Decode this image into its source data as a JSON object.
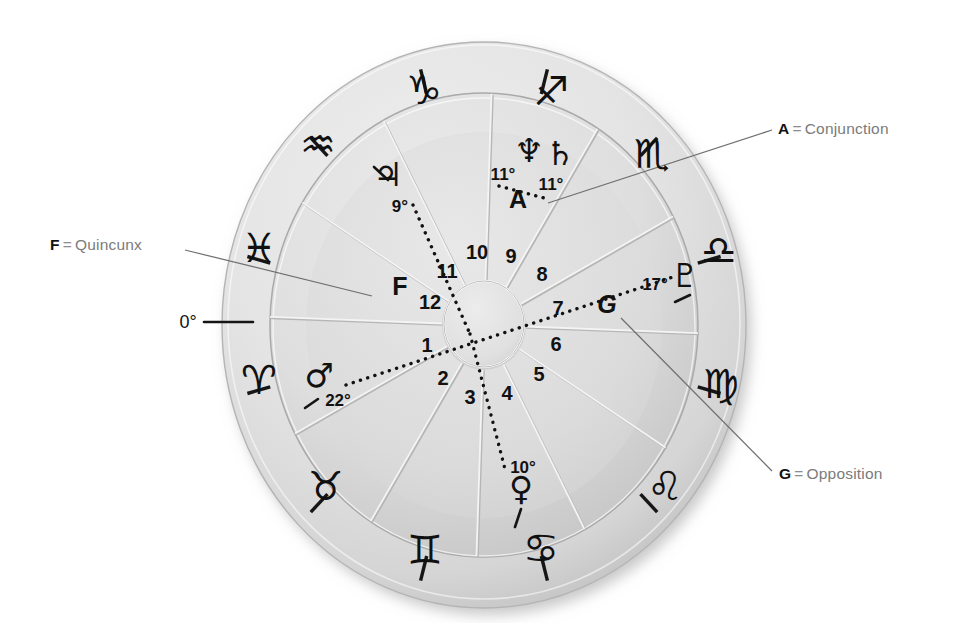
{
  "figure": {
    "type": "astrological-natal-chart-wheel"
  },
  "colors": {
    "background": "#ffffff",
    "disc_light": "#e9e9e9",
    "disc_mid": "#dcdcdc",
    "disc_dark": "#c9c9c9",
    "ink": "#121212",
    "callout_text": "#7b7b7b",
    "leader_line": "#6f6f6f",
    "groove": "#ffffff",
    "groove_shadow": "#b9b9b9"
  },
  "zodiac": {
    "ring_label": "zodiac-outer-ring",
    "signs": [
      {
        "name": "Capricorn",
        "glyph": "♑",
        "slot": 0
      },
      {
        "name": "Sagittarius",
        "glyph": "♐",
        "slot": 1
      },
      {
        "name": "Scorpio",
        "glyph": "♏",
        "slot": 2
      },
      {
        "name": "Libra",
        "glyph": "♎",
        "slot": 3
      },
      {
        "name": "Virgo",
        "glyph": "♍",
        "slot": 4
      },
      {
        "name": "Leo",
        "glyph": "♌",
        "slot": 5
      },
      {
        "name": "Cancer",
        "glyph": "♋",
        "slot": 6
      },
      {
        "name": "Gemini",
        "glyph": "♊",
        "slot": 7
      },
      {
        "name": "Taurus",
        "glyph": "♉",
        "slot": 8
      },
      {
        "name": "Aries",
        "glyph": "♈",
        "slot": 9
      },
      {
        "name": "Pisces",
        "glyph": "♓",
        "slot": 10
      },
      {
        "name": "Aquarius",
        "glyph": "♒",
        "slot": 11
      }
    ]
  },
  "houses": {
    "ring_label": "house-number-ring",
    "numbers": [
      "1",
      "2",
      "3",
      "4",
      "5",
      "6",
      "7",
      "8",
      "9",
      "10",
      "11",
      "12"
    ]
  },
  "planets": [
    {
      "name": "Neptune",
      "glyph": "♆",
      "degree": "11°",
      "label": "Neptune 11 degrees"
    },
    {
      "name": "Saturn",
      "glyph": "♄",
      "degree": "11°",
      "label": "Saturn 11 degrees"
    },
    {
      "name": "Jupiter",
      "glyph": "♃",
      "degree": "9°",
      "label": "Jupiter 9 degrees"
    },
    {
      "name": "Mars",
      "glyph": "♂",
      "degree": "22°",
      "label": "Mars 22 degrees"
    },
    {
      "name": "Venus",
      "glyph": "♀",
      "degree": "10°",
      "label": "Venus 10 degrees"
    },
    {
      "name": "Pluto",
      "glyph": "♇",
      "degree": "17°",
      "label": "Pluto 17 degrees"
    }
  ],
  "aspect_markers": [
    {
      "letter": "A",
      "aspect": "Conjunction"
    },
    {
      "letter": "F",
      "aspect": "Quincunx"
    },
    {
      "letter": "G",
      "aspect": "Opposition"
    }
  ],
  "callouts": [
    {
      "id": "a",
      "key": "A",
      "eq": "=",
      "text": "Conjunction"
    },
    {
      "id": "f",
      "key": "F",
      "eq": "=",
      "text": "Quincunx"
    },
    {
      "id": "g",
      "key": "G",
      "eq": "=",
      "text": "Opposition"
    }
  ],
  "scale_marker": {
    "label": "0°",
    "name": "zero-degree-marker"
  },
  "degree_labels": {
    "neptune": "11°",
    "saturn": "11°",
    "jupiter": "9°",
    "mars": "22°",
    "venus": "10°",
    "pluto": "17°"
  }
}
